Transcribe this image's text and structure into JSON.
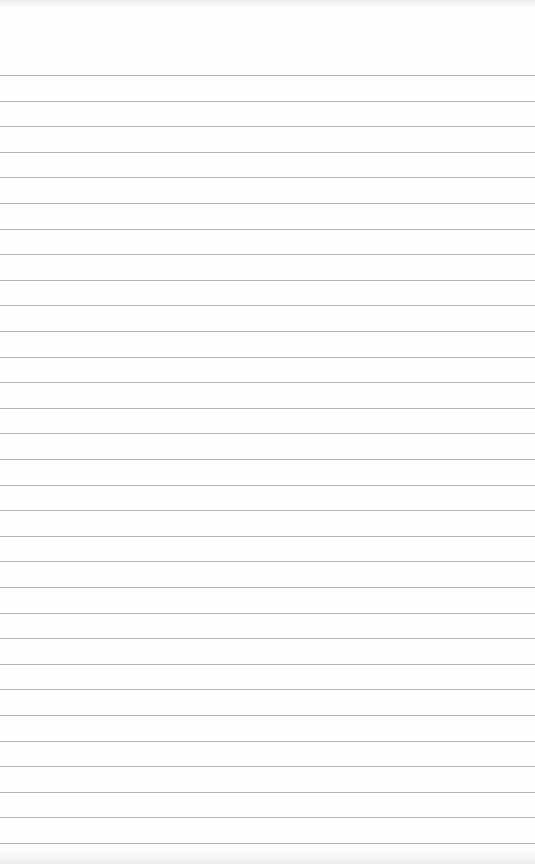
{
  "page": {
    "type": "blank lined paper",
    "background_color": "#fefefe",
    "line_color": "#b4b4b4",
    "first_line_y": 75,
    "line_spacing": 25.6,
    "line_count": 31
  }
}
